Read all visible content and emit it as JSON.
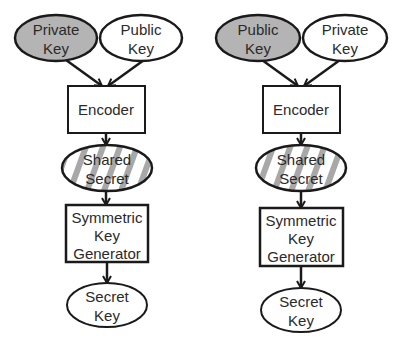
{
  "colors": {
    "stroke": "#1a1a1a",
    "gray_fill": "#b4b4b4",
    "stripe": "#a8a8a8",
    "white": "#ffffff"
  },
  "diagrams": [
    {
      "name": "left",
      "input_left": {
        "line1": "Private",
        "line2": "Key",
        "filled": true
      },
      "input_right": {
        "line1": "Public",
        "line2": "Key",
        "filled": false
      },
      "encoder": {
        "label": "Encoder"
      },
      "shared": {
        "line1": "Shared",
        "line2": "Secret"
      },
      "generator": {
        "line1": "Symmetric",
        "line2": "Key",
        "line3": "Generator"
      },
      "output": {
        "line1": "Secret",
        "line2": "Key"
      }
    },
    {
      "name": "right",
      "input_left": {
        "line1": "Public",
        "line2": "Key",
        "filled": true
      },
      "input_right": {
        "line1": "Private",
        "line2": "Key",
        "filled": false
      },
      "encoder": {
        "label": "Encoder"
      },
      "shared": {
        "line1": "Shared",
        "line2": "Secret"
      },
      "generator": {
        "line1": "Symmetric",
        "line2": "Key",
        "line3": "Generator"
      },
      "output": {
        "line1": "Secret",
        "line2": "Key"
      }
    }
  ]
}
